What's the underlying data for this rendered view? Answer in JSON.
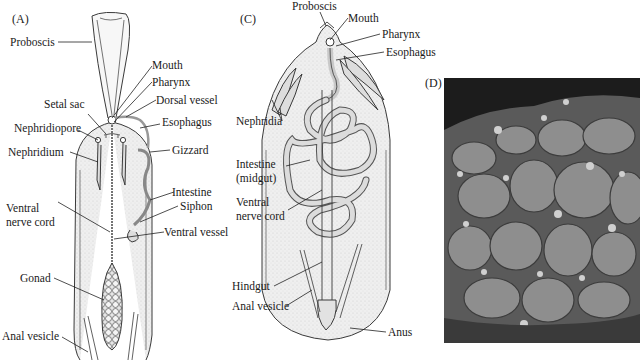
{
  "panels": {
    "A": {
      "label": "(A)",
      "labels": {
        "proboscis": "Proboscis",
        "mouth": "Mouth",
        "pharynx": "Pharynx",
        "dorsal_vessel": "Dorsal vessel",
        "setal_sac": "Setal sac",
        "esophagus": "Esophagus",
        "nephridiopore": "Nephridiopore",
        "nephridium": "Nephridium",
        "gizzard": "Gizzard",
        "intestine": "Intestine",
        "siphon": "Siphon",
        "ventral_nerve_cord_1": "Ventral",
        "ventral_nerve_cord_2": "nerve cord",
        "ventral_vessel": "Ventral vessel",
        "gonad": "Gonad",
        "anal_vesicle": "Anal vesicle"
      }
    },
    "C": {
      "label": "(C)",
      "labels": {
        "proboscis": "Proboscis",
        "mouth": "Mouth",
        "pharynx": "Pharynx",
        "esophagus": "Esophagus",
        "nephridia": "Nephridia",
        "intestine_1": "Intestine",
        "intestine_2": "(midgut)",
        "ventral_nerve_cord_1": "Ventral",
        "ventral_nerve_cord_2": "nerve cord",
        "hindgut": "Hindgut",
        "anal_vesicle": "Anal vesicle",
        "anus": "Anus"
      }
    },
    "D": {
      "label": "(D)",
      "image": "scanning-electron-micrograph"
    }
  },
  "colors": {
    "line": "#3a3a3a",
    "body_fill": "#ececec",
    "gut_fill": "#dcdcdc",
    "sem_bg": "#1c1c1c",
    "sem_lobe": "#8a8a8a"
  }
}
